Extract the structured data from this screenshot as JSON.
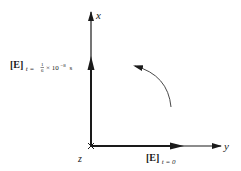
{
  "diagram": {
    "type": "vector-rotation",
    "axes": {
      "x_label": "x",
      "y_label": "y",
      "z_label": "z"
    },
    "vectors": [
      {
        "name": "E at t=0",
        "symbol": "[E]",
        "subscript": "t = 0",
        "direction": "+y"
      },
      {
        "name": "E at t=1/6 x 10^-8 s",
        "symbol": "[E]",
        "subscript_prefix": "t = ",
        "subscript_fraction_num": "1",
        "subscript_fraction_den": "6",
        "subscript_times": "× 10",
        "subscript_exponent": "−8",
        "subscript_unit": "s",
        "direction": "+x"
      }
    ],
    "rotation_arrow": {
      "direction": "counterclockwise (from +y toward +x)"
    },
    "colors": {
      "ink": "#1a1a1a",
      "background": "#ffffff"
    }
  }
}
